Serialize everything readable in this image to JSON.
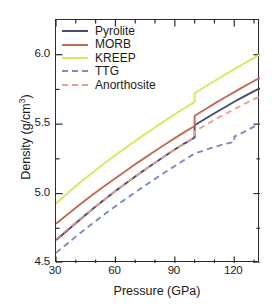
{
  "chart_data": {
    "type": "line",
    "title": "",
    "xlabel": "Pressure (GPa)",
    "ylabel": "Density (g/cm3)",
    "ylabel_base": "Density (g/cm",
    "ylabel_sup": "3",
    "ylabel_tail": ")",
    "xlim": [
      30,
      133
    ],
    "ylim": [
      4.5,
      6.25
    ],
    "xticks_major": [
      30,
      60,
      90,
      120
    ],
    "xticks_minor": [
      40,
      50,
      70,
      80,
      100,
      110,
      130
    ],
    "yticks_major": [
      4.5,
      5.0,
      5.5,
      6.0
    ],
    "yticks_minor": [
      4.75,
      5.25,
      5.75,
      6.25
    ],
    "xtick_labels": [
      "30",
      "60",
      "90",
      "120"
    ],
    "ytick_labels": [
      "4.5",
      "5.0",
      "5.5",
      "6.0"
    ],
    "grid": false,
    "legend_position": "upper-left",
    "series": [
      {
        "name": "Pyrolite",
        "color": "#454a6e",
        "dash": "solid",
        "linewidth": 1.9,
        "points": [
          [
            30,
            4.665
          ],
          [
            35,
            4.725
          ],
          [
            40,
            4.787
          ],
          [
            45,
            4.848
          ],
          [
            50,
            4.907
          ],
          [
            55,
            4.963
          ],
          [
            60,
            5.018
          ],
          [
            65,
            5.071
          ],
          [
            70,
            5.123
          ],
          [
            75,
            5.173
          ],
          [
            80,
            5.222
          ],
          [
            85,
            5.27
          ],
          [
            90,
            5.317
          ],
          [
            95,
            5.362
          ],
          [
            100,
            5.404
          ],
          [
            100,
            5.492
          ],
          [
            105,
            5.535
          ],
          [
            110,
            5.578
          ],
          [
            115,
            5.62
          ],
          [
            120,
            5.661
          ],
          [
            125,
            5.7
          ],
          [
            130,
            5.738
          ],
          [
            133,
            5.758
          ]
        ]
      },
      {
        "name": "MORB",
        "color": "#c16a56",
        "dash": "solid",
        "linewidth": 1.9,
        "points": [
          [
            30,
            4.782
          ],
          [
            35,
            4.84
          ],
          [
            40,
            4.898
          ],
          [
            45,
            4.954
          ],
          [
            50,
            5.008
          ],
          [
            55,
            5.06
          ],
          [
            60,
            5.11
          ],
          [
            65,
            5.161
          ],
          [
            70,
            5.211
          ],
          [
            75,
            5.259
          ],
          [
            80,
            5.307
          ],
          [
            85,
            5.353
          ],
          [
            90,
            5.399
          ],
          [
            95,
            5.444
          ],
          [
            100,
            5.487
          ],
          [
            100,
            5.56
          ],
          [
            105,
            5.604
          ],
          [
            110,
            5.648
          ],
          [
            115,
            5.69
          ],
          [
            120,
            5.731
          ],
          [
            125,
            5.772
          ],
          [
            130,
            5.811
          ],
          [
            133,
            5.833
          ]
        ]
      },
      {
        "name": "KREEP",
        "color": "#d6e85c",
        "dash": "solid",
        "linewidth": 1.9,
        "points": [
          [
            30,
            4.928
          ],
          [
            35,
            4.992
          ],
          [
            40,
            5.054
          ],
          [
            45,
            5.112
          ],
          [
            50,
            5.168
          ],
          [
            55,
            5.223
          ],
          [
            60,
            5.276
          ],
          [
            65,
            5.328
          ],
          [
            70,
            5.379
          ],
          [
            75,
            5.428
          ],
          [
            80,
            5.477
          ],
          [
            85,
            5.524
          ],
          [
            90,
            5.571
          ],
          [
            95,
            5.616
          ],
          [
            100,
            5.66
          ],
          [
            100,
            5.722
          ],
          [
            105,
            5.767
          ],
          [
            110,
            5.811
          ],
          [
            115,
            5.854
          ],
          [
            120,
            5.896
          ],
          [
            125,
            5.937
          ],
          [
            130,
            5.977
          ],
          [
            133,
            6.0
          ]
        ]
      },
      {
        "name": "TTG",
        "color": "#7b8ac4",
        "dash": "dashed",
        "linewidth": 1.9,
        "points": [
          [
            30,
            4.573
          ],
          [
            35,
            4.632
          ],
          [
            40,
            4.69
          ],
          [
            45,
            4.747
          ],
          [
            50,
            4.802
          ],
          [
            55,
            4.856
          ],
          [
            60,
            4.908
          ],
          [
            65,
            4.959
          ],
          [
            70,
            5.009
          ],
          [
            75,
            5.058
          ],
          [
            80,
            5.106
          ],
          [
            85,
            5.153
          ],
          [
            90,
            5.199
          ],
          [
            95,
            5.244
          ],
          [
            100,
            5.288
          ],
          [
            105,
            5.312
          ],
          [
            110,
            5.336
          ],
          [
            115,
            5.356
          ],
          [
            120,
            5.372
          ],
          [
            120,
            5.41
          ],
          [
            125,
            5.444
          ],
          [
            130,
            5.482
          ],
          [
            133,
            5.505
          ]
        ]
      },
      {
        "name": "Anorthosite",
        "color": "#e8a08a",
        "dash": "dashed",
        "linewidth": 1.9,
        "points": [
          [
            30,
            4.672
          ],
          [
            35,
            4.733
          ],
          [
            40,
            4.793
          ],
          [
            45,
            4.852
          ],
          [
            50,
            4.909
          ],
          [
            55,
            4.965
          ],
          [
            60,
            5.019
          ],
          [
            65,
            5.072
          ],
          [
            70,
            5.124
          ],
          [
            75,
            5.174
          ],
          [
            80,
            5.223
          ],
          [
            85,
            5.271
          ],
          [
            90,
            5.318
          ],
          [
            95,
            5.363
          ],
          [
            100,
            5.406
          ],
          [
            100,
            5.448
          ],
          [
            105,
            5.49
          ],
          [
            110,
            5.531
          ],
          [
            115,
            5.57
          ],
          [
            120,
            5.608
          ],
          [
            125,
            5.645
          ],
          [
            130,
            5.68
          ],
          [
            133,
            5.7
          ]
        ]
      }
    ]
  },
  "legend": {
    "items": [
      {
        "label": "Pyrolite",
        "color": "#454a6e",
        "dash": "solid"
      },
      {
        "label": "MORB",
        "color": "#c16a56",
        "dash": "solid"
      },
      {
        "label": "KREEP",
        "color": "#d6e85c",
        "dash": "solid"
      },
      {
        "label": "TTG",
        "color": "#7b8ac4",
        "dash": "dashed"
      },
      {
        "label": "Anorthosite",
        "color": "#e8a08a",
        "dash": "dashed"
      }
    ]
  },
  "axes": {
    "x_title": "Pressure (GPa)",
    "y_title_base": "Density (g/cm",
    "y_title_sup": "3",
    "y_title_tail": ")"
  },
  "colors": {
    "frame": "#2b2b2b",
    "text": "#1a1a1a",
    "background": "#ffffff"
  }
}
